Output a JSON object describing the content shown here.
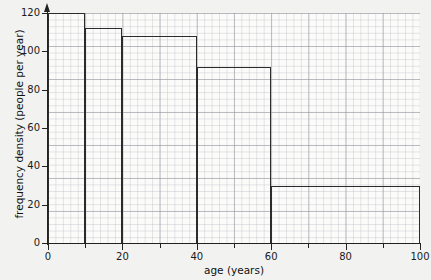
{
  "chart_data": {
    "type": "bar",
    "title": "",
    "xlabel": "age (years)",
    "ylabel": "frequency density (people per year)",
    "xlim": [
      0,
      100
    ],
    "ylim": [
      0,
      120
    ],
    "grid": true,
    "legend": "none",
    "x_major_ticks": [
      0,
      20,
      40,
      60,
      80,
      100
    ],
    "x_minor_ticks": [
      10,
      30,
      50,
      70,
      90
    ],
    "x_tick_labels": [
      "0",
      "20",
      "40",
      "60",
      "80",
      "100"
    ],
    "y_ticks": [
      0,
      20,
      40,
      60,
      80,
      100,
      120
    ],
    "y_tick_labels": [
      "0",
      "20",
      "40",
      "60",
      "80",
      "100",
      "120"
    ],
    "bins": [
      {
        "label": "0-10",
        "x_start": 0,
        "x_end": 10,
        "value": 120
      },
      {
        "label": "10-20",
        "x_start": 10,
        "x_end": 20,
        "value": 112
      },
      {
        "label": "20-40",
        "x_start": 20,
        "x_end": 40,
        "value": 108
      },
      {
        "label": "40-60",
        "x_start": 40,
        "x_end": 60,
        "value": 92
      },
      {
        "label": "60-100",
        "x_start": 60,
        "x_end": 100,
        "value": 30
      }
    ],
    "categories": [
      "0-10",
      "10-20",
      "20-40",
      "40-60",
      "60-100"
    ],
    "values": [
      120,
      112,
      108,
      92,
      30
    ]
  },
  "style": {
    "page_background": "#f2f2f0",
    "plot_background": "#fbfbfa",
    "axis_color": "#222222",
    "bar_outline_color": "#2b2b2b",
    "grid_minor_color": "#aaaab4",
    "grid_major_color": "#9696a0",
    "text_color": "#111111"
  }
}
